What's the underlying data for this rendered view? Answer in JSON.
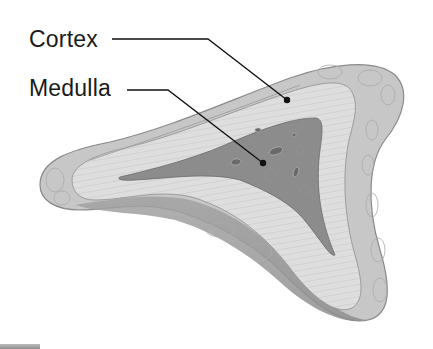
{
  "figure": {
    "style": "grayscale anatomical illustration",
    "labels": [
      {
        "id": "cortex",
        "text": "Cortex"
      },
      {
        "id": "medulla",
        "text": "Medulla"
      }
    ],
    "colors": {
      "background": "#ffffff",
      "capsule_outer": "#c9c9c9",
      "capsule_lobules": "#bdbdbd",
      "cortex": "#dedede",
      "cortex_striations": "#a8a8a8",
      "medulla": "#8a8a8a",
      "medulla_vessels": "#5e5e5e",
      "underside_shadow": "#9a9a9a",
      "label_text": "#1a1a1a",
      "leader_line": "#111111"
    }
  }
}
